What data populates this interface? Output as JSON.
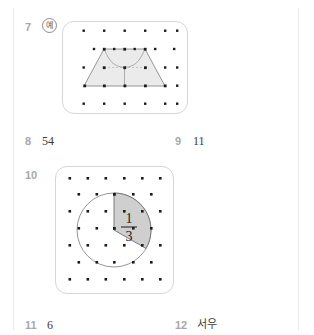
{
  "page": {
    "background": "#ffffff",
    "rule_color": "#e9e9e9",
    "qnum_color": "#a8a8a8",
    "answer_color": "#3a3a3a"
  },
  "items": [
    {
      "number": "7",
      "answer_badge": "예",
      "answer_text": "",
      "figure": "geoboard-trapezoid"
    },
    {
      "number": "8",
      "answer_text": "54"
    },
    {
      "number": "9",
      "answer_text": "11"
    },
    {
      "number": "10",
      "answer_text": "",
      "figure": "geoboard-circle-third",
      "fraction": {
        "numerator": "1",
        "denominator": "3"
      }
    },
    {
      "number": "11",
      "answer_text": "6"
    },
    {
      "number": "12",
      "answer_text": "서우"
    }
  ],
  "figures": {
    "geoboard_trapezoid": {
      "name": "geoboard-trapezoid",
      "rows": 4,
      "cols": 6,
      "dot_color": "#1c1c1c",
      "shape_fill": "#ebebeb",
      "shape_stroke": "#8a8a8a",
      "divider_stroke": "#9a9a9a",
      "description": "Large trapezoid on a staggered pin board divided into three congruent pieces"
    },
    "geoboard_circle": {
      "name": "geoboard-circle-third",
      "rows": 7,
      "cols": 6,
      "dot_color": "#1c1c1c",
      "circle_stroke": "#8a8a8a",
      "sector_fill": "#cfcfcf",
      "sector_stroke": "#6e6e6e",
      "sector_degrees": 120,
      "description": "Circle with one third sector shaded, labelled one third"
    }
  }
}
